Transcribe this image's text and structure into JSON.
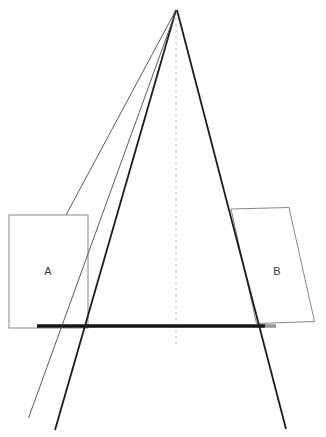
{
  "page": {
    "background": "#ffffff"
  },
  "diagram": {
    "width": 326,
    "height": 437,
    "labels": {
      "plane_a": "A",
      "plane_b": "B"
    },
    "label_positions": {
      "plane_a": {
        "x": 48,
        "y": 271
      },
      "plane_b": {
        "x": 277,
        "y": 271
      }
    },
    "colors": {
      "thick_line": "#1c1c1c",
      "thin_line": "#4a4a4a",
      "dashed_line": "#b8b8b8",
      "shape_border": "#878787",
      "baseline_black": "#141414",
      "baseline_gray": "#9a9a9a",
      "label_text": "#3a3a3a",
      "shape_fill": "#ffffff",
      "background": "#ffffff"
    },
    "elements": [
      {
        "name": "sight-line-upper",
        "type": "line",
        "x1": 176,
        "y1": 10,
        "x2": 66,
        "y2": 215,
        "stroke": "thin_line",
        "width": 0.9
      },
      {
        "name": "plane-a",
        "type": "rect",
        "x": 9,
        "y": 215,
        "w": 79,
        "h": 113,
        "stroke": "shape_border",
        "width": 1,
        "fill": "shape_fill"
      },
      {
        "name": "plane-b",
        "type": "polygon",
        "points": [
          [
            231,
            209
          ],
          [
            289,
            207.5
          ],
          [
            314.5,
            321.5
          ],
          [
            256.5,
            323.5
          ]
        ],
        "stroke": "shape_border",
        "width": 1,
        "fill": "shape_fill"
      },
      {
        "name": "center-axis",
        "type": "line",
        "x1": 176,
        "y1": 12,
        "x2": 176,
        "y2": 344,
        "stroke": "dashed_line",
        "width": 1,
        "dash": "2.5 3.5"
      },
      {
        "name": "baseline",
        "type": "line",
        "x1": 37,
        "y1": 326,
        "x2": 265,
        "y2": 326,
        "stroke": "baseline_black",
        "width": 3.6
      },
      {
        "name": "baseline-end-cap",
        "type": "line",
        "x1": 265,
        "y1": 326,
        "x2": 276,
        "y2": 326,
        "stroke": "baseline_gray",
        "width": 3.6
      },
      {
        "name": "cone-edge-left",
        "type": "line",
        "x1": 176,
        "y1": 10,
        "x2": 55,
        "y2": 430,
        "stroke": "thick_line",
        "width": 1.8
      },
      {
        "name": "cone-edge-right",
        "type": "line",
        "x1": 177,
        "y1": 10,
        "x2": 286,
        "y2": 429,
        "stroke": "thick_line",
        "width": 1.8
      },
      {
        "name": "sight-line-lower",
        "type": "line",
        "x1": 176,
        "y1": 11,
        "x2": 28.5,
        "y2": 418,
        "stroke": "thin_line",
        "width": 0.9
      }
    ]
  }
}
